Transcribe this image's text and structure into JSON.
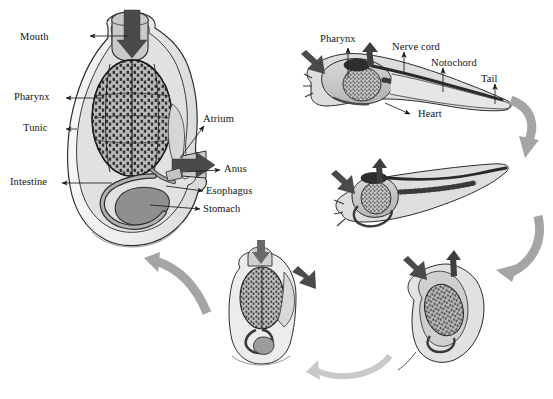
{
  "figure": {
    "background_color": "#ffffff",
    "ink_color": "#121212",
    "arrow_color": "#9a9a9a",
    "siphon_arrow_color": "#4d4d4d",
    "tissue_fill": "#cfcfcf",
    "tunic_fill": "#ececec",
    "organ_fill": "#a8a8a8",
    "dark_organ_fill": "#6e6e6e"
  },
  "adult": {
    "stage_name": "Adult sessile tunicate (cutaway)",
    "labels": [
      {
        "id": "mouth",
        "text": "Mouth",
        "x": 54,
        "y": 38,
        "align": "right"
      },
      {
        "id": "pharynx",
        "text": "Pharynx",
        "x": 22,
        "y": 95,
        "align": "right"
      },
      {
        "id": "tunic",
        "text": "Tunic",
        "x": 30,
        "y": 126,
        "align": "right"
      },
      {
        "id": "intestine",
        "text": "Intestine",
        "x": 18,
        "y": 175,
        "align": "right"
      },
      {
        "id": "atrium",
        "text": "Atrium",
        "x": 205,
        "y": 113,
        "align": "left"
      },
      {
        "id": "anus",
        "text": "Anus",
        "x": 224,
        "y": 166,
        "align": "left"
      },
      {
        "id": "esophagus",
        "text": "Esophagus",
        "x": 207,
        "y": 188,
        "align": "left"
      },
      {
        "id": "stomach",
        "text": "Stomach",
        "x": 204,
        "y": 206,
        "align": "left"
      }
    ]
  },
  "larva": {
    "stage_name": "Free-swimming tadpole larva",
    "labels": [
      {
        "id": "pharynx",
        "text": "Pharynx",
        "x": 320,
        "y": 36,
        "align": "left"
      },
      {
        "id": "nerve-cord",
        "text": "Nerve cord",
        "x": 396,
        "y": 45,
        "align": "left"
      },
      {
        "id": "notochord",
        "text": "Notochord",
        "x": 434,
        "y": 61,
        "align": "left"
      },
      {
        "id": "tail",
        "text": "Tail",
        "x": 484,
        "y": 77,
        "align": "left"
      },
      {
        "id": "heart",
        "text": "Heart",
        "x": 419,
        "y": 113,
        "align": "left"
      }
    ]
  },
  "stages": [
    {
      "id": "stage-larva",
      "order": 1,
      "name": "Swimming tadpole larva"
    },
    {
      "id": "stage-settling",
      "order": 2,
      "name": "Settled larva, tail resorbing"
    },
    {
      "id": "stage-rotating",
      "order": 3,
      "name": "Body rotating, tail reduced"
    },
    {
      "id": "stage-juvenile",
      "order": 4,
      "name": "Juvenile with enlarging pharynx"
    },
    {
      "id": "stage-adult",
      "order": 5,
      "name": "Adult sessile tunicate"
    }
  ],
  "cycle_arrows": [
    {
      "id": "arrow-larva-to-settling",
      "from": "stage-larva",
      "to": "stage-settling"
    },
    {
      "id": "arrow-settling-to-rotating",
      "from": "stage-settling",
      "to": "stage-rotating"
    },
    {
      "id": "arrow-rotating-to-juvenile",
      "from": "stage-rotating",
      "to": "stage-juvenile"
    },
    {
      "id": "arrow-juvenile-to-adult",
      "from": "stage-juvenile",
      "to": "stage-adult"
    }
  ]
}
